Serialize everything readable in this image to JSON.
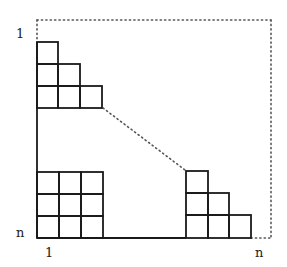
{
  "diagram": {
    "labels": {
      "row_top": "1",
      "row_bottom": "n",
      "col_left": "1",
      "col_right": "n"
    },
    "colors": {
      "line": "#1a1a1a",
      "dotted": "#555555",
      "background": "#ffffff"
    },
    "shapes": {
      "top_left_staircase_rows": [
        1,
        2,
        3
      ],
      "bottom_left_grid": {
        "rows": 3,
        "cols": 3
      },
      "bottom_right_staircase_rows": [
        1,
        2,
        3
      ]
    }
  }
}
